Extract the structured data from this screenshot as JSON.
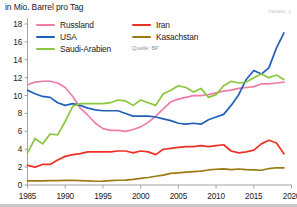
{
  "header": {
    "unit_label": "in Mio. Barrel pro Tag",
    "graphic_id": "2300861_1"
  },
  "legend": {
    "source_note": "Quelle: BP",
    "items": [
      {
        "label": "Russland",
        "color": "#f07ca8",
        "icon": "line-swatch"
      },
      {
        "label": "USA",
        "color": "#2060b8",
        "icon": "line-swatch"
      },
      {
        "label": "Saudi-Arabien",
        "color": "#8cc63f",
        "icon": "line-swatch"
      },
      {
        "label": "Iran",
        "color": "#ee3124",
        "icon": "line-swatch"
      },
      {
        "label": "Kasachstan",
        "color": "#9c7a12",
        "icon": "line-swatch"
      }
    ]
  },
  "axes": {
    "y_ticks": [
      "18",
      "16",
      "14",
      "12",
      "10",
      "8",
      "6",
      "4",
      "2",
      "0"
    ],
    "x_ticks": [
      "1985",
      "1990",
      "1995",
      "2000",
      "2005",
      "2010",
      "2015",
      "2020"
    ]
  },
  "chart_data": {
    "type": "line",
    "title": "in Mio. Barrel pro Tag",
    "xlabel": "",
    "ylabel": "in Mio. Barrel pro Tag",
    "xlim": [
      1985,
      2020
    ],
    "ylim": [
      0,
      18
    ],
    "grid": false,
    "legend_position": "top-left",
    "source": "Quelle: BP",
    "x": [
      1985,
      1986,
      1987,
      1988,
      1989,
      1990,
      1991,
      1992,
      1993,
      1994,
      1995,
      1996,
      1997,
      1998,
      1999,
      2000,
      2001,
      2002,
      2003,
      2004,
      2005,
      2006,
      2007,
      2008,
      2009,
      2010,
      2011,
      2012,
      2013,
      2014,
      2015,
      2016,
      2017,
      2018,
      2019
    ],
    "series": [
      {
        "name": "Russland",
        "color": "#f07ca8",
        "values": [
          11.2,
          11.5,
          11.6,
          11.6,
          11.4,
          10.9,
          9.9,
          8.6,
          7.8,
          6.9,
          6.3,
          6.1,
          6.1,
          6.0,
          6.2,
          6.5,
          7.0,
          7.7,
          8.5,
          9.3,
          9.6,
          9.8,
          10.0,
          10.0,
          10.1,
          10.3,
          10.5,
          10.6,
          10.8,
          10.9,
          11.0,
          11.3,
          11.3,
          11.4,
          11.5
        ]
      },
      {
        "name": "USA",
        "color": "#2060b8",
        "values": [
          10.6,
          10.2,
          9.9,
          9.8,
          9.2,
          8.9,
          9.1,
          8.9,
          8.6,
          8.4,
          8.3,
          8.3,
          8.3,
          8.0,
          7.7,
          7.7,
          7.7,
          7.6,
          7.4,
          7.2,
          6.9,
          6.8,
          6.9,
          6.8,
          7.3,
          7.6,
          7.9,
          8.9,
          10.1,
          11.8,
          12.8,
          12.4,
          13.1,
          15.3,
          17.0
        ]
      },
      {
        "name": "Saudi-Arabien",
        "color": "#8cc63f",
        "values": [
          3.6,
          5.2,
          4.6,
          5.7,
          5.6,
          7.1,
          8.8,
          9.1,
          9.1,
          9.1,
          9.1,
          9.2,
          9.5,
          9.4,
          8.9,
          9.5,
          9.2,
          8.9,
          10.2,
          10.6,
          11.1,
          10.9,
          10.4,
          10.8,
          9.8,
          10.1,
          11.1,
          11.6,
          11.4,
          11.5,
          12.0,
          12.4,
          12.0,
          12.3,
          11.8
        ]
      },
      {
        "name": "Iran",
        "color": "#ee3124",
        "values": [
          2.2,
          2.0,
          2.3,
          2.3,
          2.8,
          3.2,
          3.4,
          3.5,
          3.7,
          3.7,
          3.7,
          3.7,
          3.8,
          3.8,
          3.6,
          3.8,
          3.7,
          3.4,
          4.0,
          4.1,
          4.2,
          4.3,
          4.3,
          4.4,
          4.3,
          4.4,
          4.5,
          3.8,
          3.6,
          3.7,
          3.9,
          4.6,
          5.0,
          4.7,
          3.5
        ]
      },
      {
        "name": "Kasachstan",
        "color": "#9c7a12",
        "values": [
          0.45,
          0.46,
          0.47,
          0.48,
          0.5,
          0.52,
          0.53,
          0.5,
          0.46,
          0.42,
          0.43,
          0.48,
          0.53,
          0.54,
          0.63,
          0.74,
          0.84,
          0.98,
          1.1,
          1.3,
          1.36,
          1.43,
          1.49,
          1.55,
          1.68,
          1.76,
          1.8,
          1.72,
          1.79,
          1.72,
          1.7,
          1.65,
          1.84,
          1.93,
          1.92
        ]
      }
    ]
  }
}
